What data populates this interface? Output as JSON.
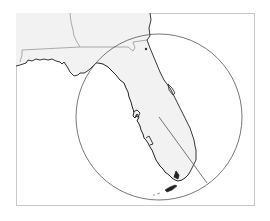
{
  "map": {
    "region": "Florida",
    "colors": {
      "land": "#f2f2f2",
      "water": "#ffffff",
      "coastline": "#222222",
      "state_border": "#888888",
      "circle": "#555555",
      "frame": "#c8c8c8"
    },
    "overlay": {
      "type": "radius-circle",
      "center_px": [
        159,
        117
      ],
      "radius_px": 83,
      "radius_line_end_px": [
        207,
        183
      ]
    },
    "marker": {
      "type": "point",
      "position_px": [
        146,
        49
      ]
    }
  }
}
